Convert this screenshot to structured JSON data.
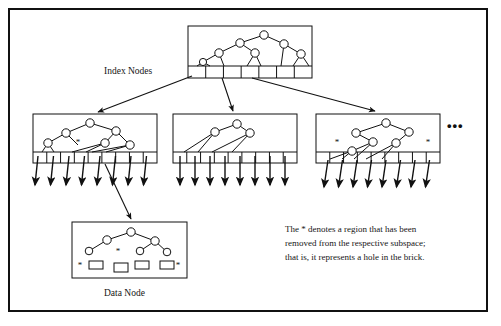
{
  "figure": {
    "type": "diagram",
    "background_color": "#ffffff",
    "ink_color": "#111111",
    "frame": {
      "x": 8,
      "y": 8,
      "width": 480,
      "height": 304,
      "border_width": 2
    }
  },
  "labels": {
    "index_nodes": "Index Nodes",
    "data_node": "Data Node",
    "ellipsis": "•••"
  },
  "caption": {
    "line1": "The * denotes a region that has been",
    "line2": "removed from the respective subspace;",
    "line3": "that is, it represents a hole in the brick."
  },
  "nodes": {
    "root": {
      "name": "root-index-node",
      "box": {
        "x": 188,
        "y": 26,
        "width": 124,
        "height": 52
      },
      "slot_row_y": 66,
      "slot_count": 7,
      "stars": [],
      "tree": {
        "circles": [
          {
            "id": "r0",
            "cx": 264,
            "cy": 35,
            "r": 4.2
          },
          {
            "id": "r1",
            "cx": 240,
            "cy": 43,
            "r": 4.2
          },
          {
            "id": "r2",
            "cx": 284,
            "cy": 44,
            "r": 4.2
          },
          {
            "id": "r3",
            "cx": 219,
            "cy": 53,
            "r": 4.2
          },
          {
            "id": "r4",
            "cx": 255,
            "cy": 53,
            "r": 4.2
          },
          {
            "id": "r5",
            "cx": 301,
            "cy": 54,
            "r": 4.2
          },
          {
            "id": "r6",
            "cx": 203,
            "cy": 62,
            "r": 3.6
          }
        ],
        "edges": [
          [
            "r0",
            "r1"
          ],
          [
            "r0",
            "r2"
          ],
          [
            "r1",
            "r3"
          ],
          [
            "r1",
            "r4"
          ],
          [
            "r2",
            "r5"
          ],
          [
            "r3",
            "r6"
          ]
        ],
        "legs": [
          {
            "from": "r6",
            "to": [
              197,
              66
            ]
          },
          {
            "from": "r6",
            "to": [
              210,
              66
            ]
          },
          {
            "from": "r3",
            "to": [
              224,
              66
            ]
          },
          {
            "from": "r4",
            "to": [
              247,
              66
            ]
          },
          {
            "from": "r4",
            "to": [
              261,
              66
            ]
          },
          {
            "from": "r2",
            "to": [
              281,
              66
            ]
          },
          {
            "from": "r5",
            "to": [
              293,
              66
            ]
          },
          {
            "from": "r5",
            "to": [
              309,
              66
            ]
          }
        ]
      }
    },
    "child_left": {
      "name": "index-node-left",
      "box": {
        "x": 33,
        "y": 114,
        "width": 124,
        "height": 49
      },
      "slot_row_y": 152,
      "slot_count": 9,
      "stars": [
        {
          "x": 78,
          "y": 145
        }
      ],
      "tree": {
        "circles": [
          {
            "id": "l0",
            "cx": 90,
            "cy": 123,
            "r": 4.2
          },
          {
            "id": "l1",
            "cx": 66,
            "cy": 133,
            "r": 4.2
          },
          {
            "id": "l2",
            "cx": 116,
            "cy": 131,
            "r": 4.2
          },
          {
            "id": "l3",
            "cx": 48,
            "cy": 143,
            "r": 4.2
          },
          {
            "id": "l4",
            "cx": 105,
            "cy": 143,
            "r": 4.2
          },
          {
            "id": "l5",
            "cx": 130,
            "cy": 145,
            "r": 4.2
          }
        ],
        "edges": [
          [
            "l0",
            "l1"
          ],
          [
            "l0",
            "l2"
          ],
          [
            "l1",
            "l3"
          ],
          [
            "l1",
            "l_star"
          ],
          [
            "l2",
            "l4"
          ],
          [
            "l2",
            "l5"
          ]
        ],
        "legs": [
          {
            "from": "l3",
            "to": [
              42,
              152
            ]
          },
          {
            "from": "l3",
            "to": [
              54,
              152
            ]
          },
          {
            "from": "l4",
            "to": [
              72,
              152
            ]
          },
          {
            "from": "l4",
            "to": [
              86,
              152
            ]
          },
          {
            "from": "l5",
            "to": [
              92,
              152
            ]
          },
          {
            "from": "l5",
            "to": [
              106,
              152
            ]
          }
        ]
      }
    },
    "child_middle": {
      "name": "index-node-middle",
      "box": {
        "x": 173,
        "y": 114,
        "width": 124,
        "height": 49
      },
      "slot_row_y": 152,
      "slot_count": 9,
      "stars": [],
      "tree": {
        "circles": [
          {
            "id": "m0",
            "cx": 237,
            "cy": 124,
            "r": 4.2
          },
          {
            "id": "m1",
            "cx": 215,
            "cy": 132,
            "r": 4.2
          },
          {
            "id": "m2",
            "cx": 250,
            "cy": 133,
            "r": 4.2
          }
        ],
        "edges": [
          [
            "m0",
            "m1"
          ],
          [
            "m0",
            "m2"
          ]
        ],
        "legs": [
          {
            "from": "m1",
            "to": [
              184,
              152
            ]
          },
          {
            "from": "m1",
            "to": [
              198,
              152
            ]
          },
          {
            "from": "m2",
            "to": [
              212,
              152
            ]
          },
          {
            "from": "m2",
            "to": [
              232,
              152
            ]
          }
        ]
      }
    },
    "child_right": {
      "name": "index-node-right",
      "box": {
        "x": 316,
        "y": 114,
        "width": 124,
        "height": 49
      },
      "slot_row_y": 152,
      "slot_count": 9,
      "stars": [
        {
          "x": 337,
          "y": 145
        },
        {
          "x": 428,
          "y": 145
        }
      ],
      "tree": {
        "circles": [
          {
            "id": "n0",
            "cx": 386,
            "cy": 123,
            "r": 4.2
          },
          {
            "id": "n1",
            "cx": 356,
            "cy": 133,
            "r": 4.2
          },
          {
            "id": "n2",
            "cx": 409,
            "cy": 132,
            "r": 4.2
          },
          {
            "id": "n3",
            "cx": 373,
            "cy": 142,
            "r": 4.2
          },
          {
            "id": "n4",
            "cx": 396,
            "cy": 143,
            "r": 4.2
          },
          {
            "id": "n5",
            "cx": 352,
            "cy": 151,
            "r": 4.2
          }
        ],
        "edges": [
          [
            "n0",
            "n1"
          ],
          [
            "n0",
            "n2"
          ],
          [
            "n1",
            "n3"
          ],
          [
            "n2",
            "n4"
          ],
          [
            "n3",
            "n5"
          ]
        ],
        "legs": [
          {
            "from": "n5",
            "to": [
              330,
              159
            ]
          },
          {
            "from": "n5",
            "to": [
              342,
              159
            ]
          },
          {
            "from": "n3",
            "to": [
              354,
              159
            ]
          },
          {
            "from": "n4",
            "to": [
              366,
              159
            ]
          },
          {
            "from": "n4",
            "to": [
              382,
              159
            ]
          }
        ]
      }
    },
    "data_node": {
      "name": "data-node",
      "box": {
        "x": 72,
        "y": 222,
        "width": 115,
        "height": 56
      },
      "stars": [
        {
          "x": 80,
          "y": 268
        },
        {
          "x": 118,
          "y": 254
        },
        {
          "x": 178,
          "y": 268
        }
      ],
      "tree": {
        "circles": [
          {
            "id": "d0",
            "cx": 131,
            "cy": 232,
            "r": 4.2
          },
          {
            "id": "d1",
            "cx": 107,
            "cy": 240,
            "r": 4.2
          },
          {
            "id": "d2",
            "cx": 155,
            "cy": 241,
            "r": 4.2
          },
          {
            "id": "d3",
            "cx": 89,
            "cy": 251,
            "r": 3.8
          },
          {
            "id": "d4",
            "cx": 140,
            "cy": 251,
            "r": 3.8
          },
          {
            "id": "d5",
            "cx": 167,
            "cy": 252,
            "r": 3.8
          }
        ],
        "edges": [
          [
            "d0",
            "d1"
          ],
          [
            "d0",
            "d2"
          ],
          [
            "d1",
            "d3"
          ],
          [
            "d2",
            "d4"
          ],
          [
            "d2",
            "d5"
          ]
        ],
        "rects": [
          {
            "x": 89,
            "y": 261,
            "width": 14,
            "height": 8
          },
          {
            "x": 114,
            "y": 263,
            "width": 14,
            "height": 9
          },
          {
            "x": 135,
            "y": 261,
            "width": 14,
            "height": 8
          },
          {
            "x": 160,
            "y": 261,
            "width": 14,
            "height": 8
          }
        ]
      }
    }
  },
  "arrows": {
    "index_to_children": [
      {
        "name": "arrow-root-to-left",
        "x1": 192,
        "y1": 76,
        "x2": 98,
        "y2": 112
      },
      {
        "name": "arrow-root-to-middle",
        "x1": 222,
        "y1": 78,
        "x2": 233,
        "y2": 111
      },
      {
        "name": "arrow-root-to-right",
        "x1": 252,
        "y1": 78,
        "x2": 375,
        "y2": 111
      }
    ],
    "index_to_data": {
      "name": "arrow-index-to-data-node",
      "x1": 105,
      "y1": 164,
      "x2": 131,
      "y2": 219
    },
    "leaf_arrow_groups": [
      {
        "name": "leaf-arrows-left",
        "start_x": 38,
        "count": 8,
        "spacing": 15.5,
        "top_y": 156,
        "bottom_y": 185,
        "skew": 3
      },
      {
        "name": "leaf-arrows-middle",
        "start_x": 180,
        "count": 8,
        "spacing": 15.0,
        "top_y": 156,
        "bottom_y": 185,
        "skew": 0
      },
      {
        "name": "leaf-arrows-right",
        "start_x": 328,
        "count": 8,
        "spacing": 14.5,
        "top_y": 160,
        "bottom_y": 187,
        "skew": 4
      }
    ]
  }
}
